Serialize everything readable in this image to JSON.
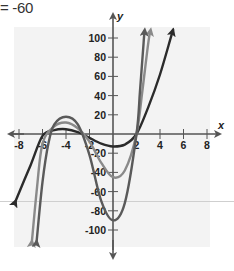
{
  "header": {
    "equation_fragment": "= -60"
  },
  "colors": {
    "axis": "#555555",
    "curve_black": "#2b2b2b",
    "curve_gray": "#8a8a8a",
    "curve_darkgray": "#5a5a5a",
    "panel": "#f3f3f3"
  },
  "chart_data": {
    "type": "line",
    "title": "",
    "xlabel": "x",
    "ylabel": "y",
    "xlim": [
      -9,
      9
    ],
    "ylim": [
      -110,
      110
    ],
    "grid": false,
    "x_ticks": [
      -8,
      -6,
      -4,
      -2,
      2,
      4,
      6,
      8
    ],
    "x_tick_labels": [
      "-8",
      "-6",
      "-4",
      "-2",
      "2",
      "4",
      "6",
      "8"
    ],
    "y_ticks": [
      100,
      80,
      60,
      40,
      20,
      -20,
      -40,
      -60,
      -80,
      -100
    ],
    "y_tick_labels": [
      "100",
      "80",
      "60",
      "40",
      "20",
      "-20",
      "-40",
      "-60",
      "-80",
      "-100"
    ],
    "series": [
      {
        "name": "curve-black",
        "color": "#2b2b2b",
        "x": [
          -8.3,
          -7,
          -6,
          -5,
          -4,
          -3,
          -2,
          -1,
          0,
          1,
          2,
          3,
          4,
          5,
          5.1
        ],
        "y": [
          -70,
          -32,
          -2,
          4,
          5,
          2,
          -4,
          -10,
          -13,
          -11,
          0,
          28,
          62,
          104,
          108
        ]
      },
      {
        "name": "curve-gray",
        "color": "#8a8a8a",
        "x": [
          -6.9,
          -6.5,
          -6,
          -5,
          -4,
          -3,
          -2,
          -1,
          0,
          1,
          2,
          2.5,
          3,
          3.2
        ],
        "y": [
          -112,
          -60,
          -10,
          8,
          12,
          6,
          -8,
          -30,
          -45,
          -38,
          0,
          45,
          95,
          108
        ]
      },
      {
        "name": "curve-darkgray",
        "color": "#5a5a5a",
        "x": [
          -6.5,
          -6,
          -5.5,
          -5,
          -4,
          -3,
          -2,
          -1,
          0,
          1,
          2,
          2.3,
          2.6,
          2.7
        ],
        "y": [
          -112,
          -50,
          -10,
          10,
          18,
          10,
          -22,
          -70,
          -90,
          -72,
          0,
          45,
          95,
          108
        ]
      }
    ]
  }
}
